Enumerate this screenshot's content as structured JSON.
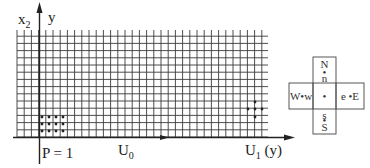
{
  "diagram": {
    "axes": {
      "vertical_label_main": "x",
      "vertical_label_sub": "2",
      "vertical_label_alt": "y",
      "horizontal_label_p": "P = 1",
      "horizontal_label_u0_main": "U",
      "horizontal_label_u0_sub": "0",
      "horizontal_label_u1_main": "U",
      "horizontal_label_u1_sub": "1",
      "horizontal_label_u1_suffix": "(y)"
    },
    "grid": {
      "x_start": 17,
      "x_end": 268,
      "y_start": 30,
      "y_end": 137,
      "spacing": 7.2,
      "line_color": "#333333"
    },
    "dot_block_left": {
      "cols": 4,
      "rows": 3,
      "points": [
        [
          42,
          117
        ],
        [
          49,
          117
        ],
        [
          56,
          117
        ],
        [
          63,
          117
        ],
        [
          42,
          124
        ],
        [
          49,
          124
        ],
        [
          56,
          124
        ],
        [
          63,
          124
        ],
        [
          42,
          131
        ],
        [
          49,
          131
        ],
        [
          56,
          131
        ],
        [
          63,
          131
        ]
      ]
    },
    "dot_block_right": {
      "points": [
        [
          255,
          102
        ],
        [
          248,
          109
        ],
        [
          255,
          109
        ],
        [
          262,
          109
        ],
        [
          255,
          117
        ]
      ]
    },
    "stencil": {
      "north_upper": "N",
      "north_lower": "n",
      "south_upper": "s",
      "south_lower": "S",
      "west": "W•w",
      "east": "e •E",
      "center": "•",
      "north_dot": "•",
      "south_dot": "•"
    }
  }
}
